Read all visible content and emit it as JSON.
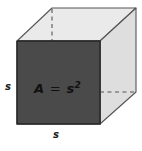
{
  "figure": {
    "name": "cube-surface-area-diagram",
    "background_color": "#ffffff",
    "width": 142,
    "height": 151
  },
  "cube": {
    "front_face": {
      "name": "front-face",
      "fill_color": "#4a4a4a",
      "stroke_color": "#2b2b2b"
    },
    "top_face": {
      "name": "top-face",
      "fill_color": "#eaeaea",
      "stroke_color": "#555555"
    },
    "right_face": {
      "name": "right-face",
      "fill_color": "#dedede",
      "stroke_color": "#555555"
    },
    "hidden_edges": {
      "name": "hidden-edges",
      "stroke_color": "#555555",
      "style": "dashed"
    }
  },
  "labels": {
    "area_formula": {
      "base": "A",
      "equals": " = ",
      "variable": "s",
      "exponent": "2",
      "full_text": "A = s2"
    },
    "side_left": "s",
    "side_bottom": "s"
  }
}
